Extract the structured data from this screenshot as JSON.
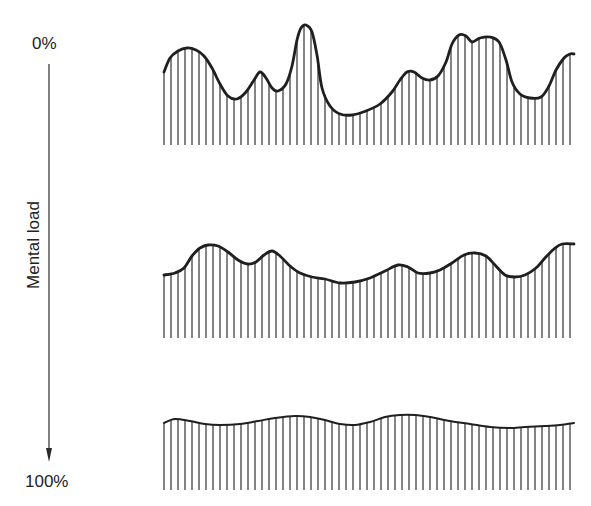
{
  "axis": {
    "top_label": "0%",
    "bottom_label": "100%",
    "title": "Mental load",
    "direction": "downward arrow"
  },
  "colors": {
    "ink": "#1f1f1f",
    "background": "#ffffff"
  },
  "panels": [
    {
      "name": "low-load",
      "description": "High variability signal (0% mental load)",
      "x_start": 164,
      "x_end": 574,
      "baseline_y": 145,
      "line_spacing": 7,
      "curve": [
        [
          164,
          72
        ],
        [
          170,
          58
        ],
        [
          178,
          51
        ],
        [
          187,
          48
        ],
        [
          196,
          50
        ],
        [
          204,
          56
        ],
        [
          212,
          68
        ],
        [
          220,
          84
        ],
        [
          228,
          96
        ],
        [
          237,
          99
        ],
        [
          246,
          92
        ],
        [
          254,
          80
        ],
        [
          260,
          72
        ],
        [
          266,
          78
        ],
        [
          272,
          88
        ],
        [
          278,
          91
        ],
        [
          286,
          84
        ],
        [
          292,
          66
        ],
        [
          297,
          40
        ],
        [
          301,
          28
        ],
        [
          306,
          25
        ],
        [
          312,
          32
        ],
        [
          317,
          55
        ],
        [
          322,
          88
        ],
        [
          330,
          106
        ],
        [
          340,
          114
        ],
        [
          352,
          115
        ],
        [
          366,
          111
        ],
        [
          380,
          104
        ],
        [
          392,
          92
        ],
        [
          400,
          80
        ],
        [
          407,
          72
        ],
        [
          414,
          72
        ],
        [
          422,
          78
        ],
        [
          430,
          80
        ],
        [
          438,
          76
        ],
        [
          446,
          62
        ],
        [
          452,
          44
        ],
        [
          459,
          35
        ],
        [
          466,
          36
        ],
        [
          472,
          42
        ],
        [
          480,
          38
        ],
        [
          490,
          37
        ],
        [
          499,
          42
        ],
        [
          506,
          60
        ],
        [
          512,
          82
        ],
        [
          520,
          94
        ],
        [
          530,
          98
        ],
        [
          541,
          97
        ],
        [
          549,
          86
        ],
        [
          556,
          70
        ],
        [
          564,
          58
        ],
        [
          570,
          54
        ],
        [
          574,
          54
        ]
      ]
    },
    {
      "name": "medium-load",
      "description": "Moderate variability signal",
      "x_start": 164,
      "x_end": 574,
      "baseline_y": 338,
      "line_spacing": 7,
      "curve": [
        [
          164,
          275
        ],
        [
          175,
          273
        ],
        [
          184,
          268
        ],
        [
          192,
          256
        ],
        [
          200,
          248
        ],
        [
          208,
          245
        ],
        [
          218,
          246
        ],
        [
          228,
          252
        ],
        [
          238,
          260
        ],
        [
          248,
          264
        ],
        [
          256,
          262
        ],
        [
          264,
          255
        ],
        [
          272,
          251
        ],
        [
          280,
          256
        ],
        [
          290,
          266
        ],
        [
          300,
          273
        ],
        [
          312,
          277
        ],
        [
          325,
          279
        ],
        [
          340,
          283
        ],
        [
          355,
          282
        ],
        [
          370,
          278
        ],
        [
          385,
          271
        ],
        [
          398,
          265
        ],
        [
          408,
          267
        ],
        [
          418,
          273
        ],
        [
          430,
          273
        ],
        [
          440,
          270
        ],
        [
          452,
          263
        ],
        [
          464,
          255
        ],
        [
          475,
          253
        ],
        [
          486,
          256
        ],
        [
          495,
          265
        ],
        [
          505,
          275
        ],
        [
          515,
          277
        ],
        [
          525,
          275
        ],
        [
          536,
          268
        ],
        [
          545,
          258
        ],
        [
          554,
          249
        ],
        [
          562,
          244
        ],
        [
          574,
          244
        ]
      ]
    },
    {
      "name": "high-load",
      "description": "Low variability (flattened) signal (100% mental load)",
      "x_start": 164,
      "x_end": 574,
      "baseline_y": 490,
      "line_spacing": 7,
      "curve": [
        [
          164,
          423
        ],
        [
          175,
          419
        ],
        [
          190,
          421
        ],
        [
          205,
          424
        ],
        [
          220,
          425
        ],
        [
          240,
          424
        ],
        [
          258,
          421
        ],
        [
          275,
          418
        ],
        [
          295,
          416
        ],
        [
          310,
          417
        ],
        [
          325,
          420
        ],
        [
          340,
          424
        ],
        [
          355,
          425
        ],
        [
          370,
          422
        ],
        [
          385,
          417
        ],
        [
          400,
          415
        ],
        [
          415,
          415
        ],
        [
          430,
          417
        ],
        [
          450,
          421
        ],
        [
          470,
          424
        ],
        [
          490,
          427
        ],
        [
          510,
          428
        ],
        [
          525,
          427
        ],
        [
          545,
          426
        ],
        [
          560,
          425
        ],
        [
          574,
          423
        ]
      ]
    }
  ]
}
